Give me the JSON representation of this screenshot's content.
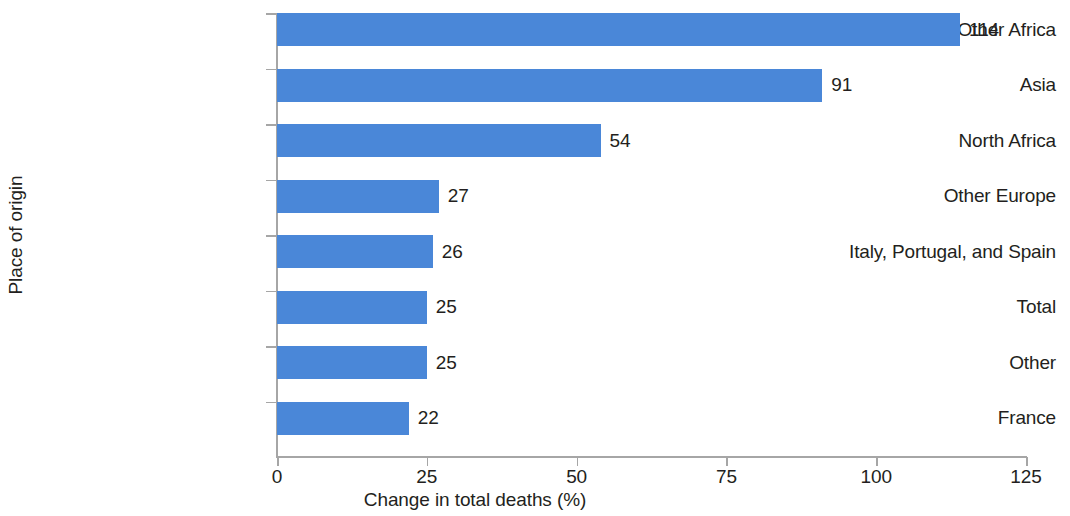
{
  "chart_data": {
    "type": "bar",
    "orientation": "horizontal",
    "title": "",
    "xlabel": "Change in total deaths (%)",
    "ylabel": "Place of origin",
    "categories": [
      "Other Africa",
      "Asia",
      "North Africa",
      "Other Europe",
      "Italy, Portugal, and Spain",
      "Total",
      "Other",
      "France"
    ],
    "values": [
      114,
      91,
      54,
      27,
      26,
      25,
      25,
      22
    ],
    "value_labels": [
      "114",
      "91",
      "54",
      "27",
      "26",
      "25",
      "25",
      "22"
    ],
    "xlim": [
      0,
      125
    ],
    "xticks": [
      0,
      25,
      50,
      75,
      100,
      125
    ],
    "xtick_labels": [
      "0",
      "25",
      "50",
      "75",
      "100",
      "125"
    ],
    "grid": false,
    "legend": null,
    "bar_color": "#4a87d8",
    "axis_color": "#a6a6a6",
    "text_color": "#231f20",
    "background": "#ffffff"
  }
}
